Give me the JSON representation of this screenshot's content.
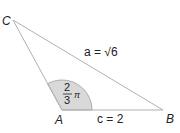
{
  "diagram": {
    "type": "triangle",
    "vertices": {
      "A": {
        "label": "A",
        "x": 62,
        "y": 110
      },
      "B": {
        "label": "B",
        "x": 163,
        "y": 110
      },
      "C": {
        "label": "C",
        "x": 13,
        "y": 20
      }
    },
    "sides": {
      "a": {
        "label": "a = √6",
        "name": "a",
        "value": "√6",
        "between": [
          "B",
          "C"
        ]
      },
      "c": {
        "label": "c = 2",
        "name": "c",
        "value": "2",
        "between": [
          "A",
          "B"
        ]
      }
    },
    "angle_A": {
      "numerator": "2",
      "denominator": "3",
      "symbol": "π",
      "value": "2π/3"
    },
    "colors": {
      "line": "#b0b0b0",
      "arc_fill": "#d9d9d9",
      "arc_stroke": "#9a9a9a",
      "text": "#222222"
    }
  }
}
